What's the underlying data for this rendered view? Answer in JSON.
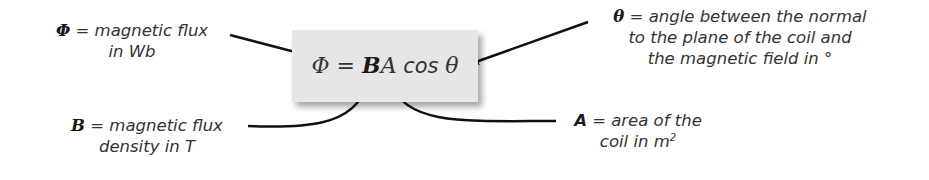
{
  "formula": {
    "lhs": "Φ",
    "eq": " = ",
    "b": "B",
    "a": "A",
    "cos": " cos ",
    "theta": "θ"
  },
  "labels": {
    "phi": {
      "symbol": "Φ",
      "line1": " = magnetic flux",
      "line2": "in Wb"
    },
    "theta": {
      "symbol": "θ",
      "line1": " = angle between the normal",
      "line2": "to the plane of the coil and",
      "line3": "the magnetic field in °"
    },
    "b": {
      "symbol": "B",
      "line1": " = magnetic flux",
      "line2": "density in T"
    },
    "a": {
      "symbol": "A",
      "line1": " = area of the",
      "line2": "coil in m",
      "line2_sup": "2"
    }
  },
  "colors": {
    "box": "#e6e6e6",
    "text": "#333333",
    "arrow": "#111111"
  }
}
